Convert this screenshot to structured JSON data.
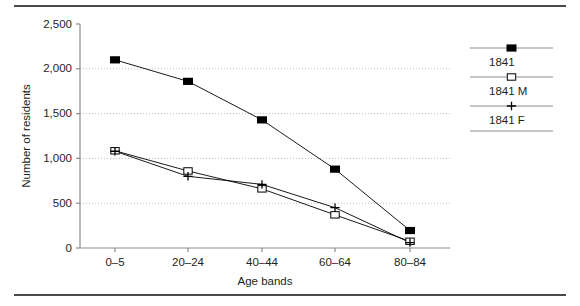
{
  "figure": {
    "name": "population-by-age-band-line-chart",
    "has_top_rule": true,
    "has_bottom_rule": true
  },
  "chart_data": {
    "type": "line",
    "title": "",
    "xlabel": "Age bands",
    "ylabel": "Number of residents",
    "categories": [
      "0–5",
      "20–24",
      "40–44",
      "60–64",
      "80–84"
    ],
    "ylim": [
      0,
      2500
    ],
    "yticks": [
      0,
      500,
      1000,
      1500,
      2000,
      2500
    ],
    "ytick_labels": [
      "0",
      "500",
      "1,000",
      "1,500",
      "2,000",
      "2,500"
    ],
    "grid": "horizontal-dotted",
    "legend_position": "right",
    "series": [
      {
        "name": "1841",
        "marker": "filled-square",
        "color": "#000000",
        "values": [
          2100,
          1860,
          1430,
          880,
          195
        ]
      },
      {
        "name": "1841 M",
        "marker": "open-square",
        "color": "#000000",
        "values": [
          1085,
          860,
          660,
          370,
          75
        ]
      },
      {
        "name": "1841 F",
        "marker": "plus",
        "color": "#000000",
        "values": [
          1080,
          800,
          710,
          450,
          60
        ]
      }
    ]
  },
  "legend": {
    "items": [
      {
        "label": "1841",
        "marker": "filled-square"
      },
      {
        "label": "1841 M",
        "marker": "open-square"
      },
      {
        "label": "1841 F",
        "marker": "plus"
      }
    ]
  }
}
